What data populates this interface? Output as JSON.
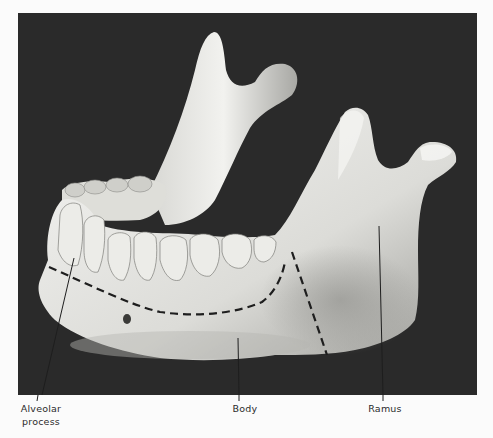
{
  "figure": {
    "background_color": "#2a2a2a",
    "bone_color": "#e9e9e6",
    "labels": [
      {
        "id": "alveolar",
        "line1": "Alveolar",
        "line2": "process"
      },
      {
        "id": "body",
        "line1": "Body"
      },
      {
        "id": "ramus",
        "line1": "Ramus"
      }
    ],
    "annotations": {
      "alveolar_body_boundary": "dashed curve",
      "body_ramus_boundary": "dashed line"
    }
  }
}
